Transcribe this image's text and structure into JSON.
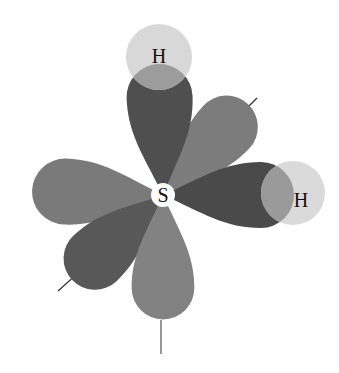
{
  "diagram": {
    "type": "orbital-overlap",
    "central_atom": {
      "label": "S",
      "x": 163,
      "y": 195
    },
    "hydrogens": [
      {
        "label": "H",
        "x": 159,
        "y": 57,
        "r": 33
      },
      {
        "label": "H",
        "x": 293,
        "y": 193,
        "r": 32
      }
    ],
    "colors": {
      "dark_lobe": "#4f4f4f",
      "medium_lobe": "#7a7a7a",
      "hydrogen": "#d6d6d6",
      "overlap": "#9a9a9a",
      "axis": "#333333",
      "background": "#ffffff"
    }
  }
}
